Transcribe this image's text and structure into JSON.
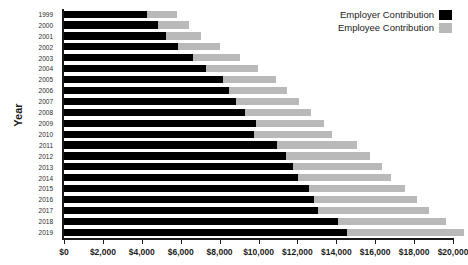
{
  "chart_data": {
    "type": "bar",
    "orientation": "horizontal",
    "stacked": true,
    "title": "",
    "xlabel": "",
    "ylabel": "Year",
    "xlim": [
      0,
      20000
    ],
    "xticks": [
      0,
      2000,
      4000,
      6000,
      8000,
      10000,
      12000,
      14000,
      16000,
      18000,
      20000
    ],
    "xticklabels": [
      "$0",
      "$2,000",
      "$4,000",
      "$6,000",
      "$8,000",
      "$10,000",
      "$12,000",
      "$14,000",
      "$16,000",
      "$18,000",
      "$20,000"
    ],
    "grid": false,
    "legend_position": "top-right",
    "categories": [
      "1999",
      "2000",
      "2001",
      "2002",
      "2003",
      "2004",
      "2005",
      "2006",
      "2007",
      "2008",
      "2009",
      "2010",
      "2011",
      "2012",
      "2013",
      "2014",
      "2015",
      "2016",
      "2017",
      "2018",
      "2019"
    ],
    "series": [
      {
        "name": "Employer Contribution",
        "color": "#000000",
        "values": [
          4247,
          4819,
          5269,
          5866,
          6657,
          7289,
          8167,
          8508,
          8824,
          9325,
          9860,
          9773,
          10944,
          11429,
          11786,
          12011,
          12591,
          12865,
          13049,
          14069,
          14561
        ]
      },
      {
        "name": "Employee Contribution",
        "color": "#b9b9b9",
        "values": [
          1543,
          1619,
          1787,
          2137,
          2412,
          2661,
          2713,
          2973,
          3281,
          3354,
          3515,
          3997,
          4129,
          4316,
          4565,
          4823,
          4955,
          5277,
          5714,
          5547,
          6015
        ]
      }
    ],
    "totals": [
      5790,
      6438,
      7056,
      8003,
      9069,
      9950,
      10880,
      11481,
      12106,
      12680,
      13375,
      13770,
      15073,
      15745,
      16351,
      16834,
      17545,
      18142,
      18764,
      19616,
      20576
    ]
  },
  "legend": {
    "items": [
      {
        "label": "Employer Contribution",
        "color": "#000000"
      },
      {
        "label": "Employee Contribution",
        "color": "#b9b9b9"
      }
    ]
  },
  "axes": {
    "y_title": "Year"
  }
}
